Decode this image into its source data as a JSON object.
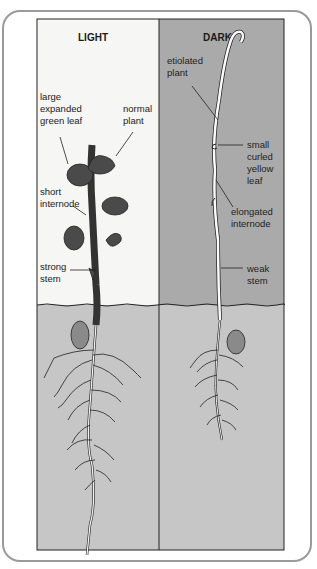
{
  "diagram": {
    "panels": [
      {
        "id": "light",
        "title": "LIGHT",
        "labels": [
          {
            "key": "large_leaf",
            "lines": [
              "large",
              "expanded",
              "green leaf"
            ]
          },
          {
            "key": "normal_plant",
            "lines": [
              "normal",
              "plant"
            ]
          },
          {
            "key": "short_internode",
            "lines": [
              "short",
              "internode"
            ]
          },
          {
            "key": "strong_stem",
            "lines": [
              "strong",
              "stem"
            ]
          }
        ]
      },
      {
        "id": "dark",
        "title": "DARK",
        "labels": [
          {
            "key": "etiolated_plant",
            "lines": [
              "etiolated",
              "plant"
            ]
          },
          {
            "key": "small_leaf",
            "lines": [
              "small",
              "curled",
              "yellow",
              "leaf"
            ]
          },
          {
            "key": "elongated_internode",
            "lines": [
              "elongated",
              "internode"
            ]
          },
          {
            "key": "weak_stem",
            "lines": [
              "weak",
              "stem"
            ]
          }
        ]
      }
    ],
    "colors": {
      "light_bg": "#f6f6f4",
      "dark_bg": "#aaaaaa",
      "soil_bg": "#c6c6c6",
      "leaf": "#4a4a4a",
      "seed": "#8a8a8a",
      "outline": "#222222"
    }
  }
}
